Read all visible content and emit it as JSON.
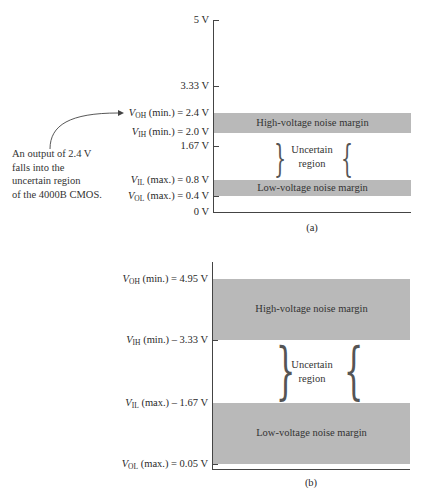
{
  "diagram_a": {
    "caption": "(a)",
    "ticks": [
      {
        "sym": "",
        "sub": "",
        "cond": "",
        "value": "5 V",
        "y": 20
      },
      {
        "sym": "",
        "sub": "",
        "cond": "",
        "value": "3.33 V",
        "y": 86
      },
      {
        "sym": "V",
        "sub": "OH",
        "cond": " (min.) = ",
        "value": "2.4 V",
        "y": 113
      },
      {
        "sym": "V",
        "sub": "IH",
        "cond": " (min.) = ",
        "value": "2.0 V",
        "y": 132
      },
      {
        "sym": "",
        "sub": "",
        "cond": "",
        "value": "1.67 V",
        "y": 146
      },
      {
        "sym": "V",
        "sub": "IL",
        "cond": " (max.) = ",
        "value": "0.8 V",
        "y": 180
      },
      {
        "sym": "V",
        "sub": "OL",
        "cond": " (max.) = ",
        "value": "0.4 V",
        "y": 196
      },
      {
        "sym": "",
        "sub": "",
        "cond": "",
        "value": "0 V",
        "y": 212
      }
    ],
    "high_band_label": "High-voltage noise margin",
    "low_band_label": "Low-voltage noise margin",
    "uncertain_line1": "Uncertain",
    "uncertain_line2": "region",
    "annotation": {
      "line1": "An output of 2.4 V",
      "line2": "falls into the",
      "line3": "uncertain region",
      "line4": "of the 4000B CMOS."
    }
  },
  "diagram_b": {
    "caption": "(b)",
    "ticks": [
      {
        "sym": "V",
        "sub": "OH",
        "cond": " (min.) = ",
        "value": "4.95 V",
        "y": 279
      },
      {
        "sym": "V",
        "sub": "IH",
        "cond": " (min.) – ",
        "value": "3.33 V",
        "y": 340
      },
      {
        "sym": "V",
        "sub": "IL",
        "cond": " (max.) – ",
        "value": "1.67 V",
        "y": 403
      },
      {
        "sym": "V",
        "sub": "OL",
        "cond": " (max.) = ",
        "value": "0.05 V",
        "y": 464
      }
    ],
    "high_band_label": "High-voltage noise margin",
    "low_band_label": "Low-voltage noise margin",
    "uncertain_line1": "Uncertain",
    "uncertain_line2": "region"
  },
  "colors": {
    "band": "#b9b9b9",
    "axis": "#444444",
    "text": "#2a2a2a"
  }
}
